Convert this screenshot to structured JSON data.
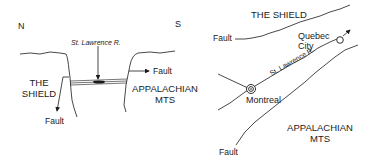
{
  "cross_section": {
    "north_label": "N",
    "south_label": "S",
    "river_label": "St. Lawrence R.",
    "shield_line1": "THE",
    "shield_line2": "SHIELD",
    "appalachian_line1": "APPALACHIAN",
    "appalachian_line2": "MTS",
    "fault_right_label": "Fault",
    "fault_left_label": "Fault"
  },
  "map_view": {
    "shield_label": "THE SHIELD",
    "fault_top_label": "Fault",
    "quebec_line1": "Quebec",
    "quebec_line2": "City",
    "river_label": "St. Lawrence R.",
    "montreal_label": "Montreal",
    "appalachian_line1": "APPALACHIAN",
    "appalachian_line2": "MTS",
    "fault_bottom_label": "Fault"
  },
  "colors": {
    "ink": "#1a1a1a",
    "background": "#ffffff"
  }
}
